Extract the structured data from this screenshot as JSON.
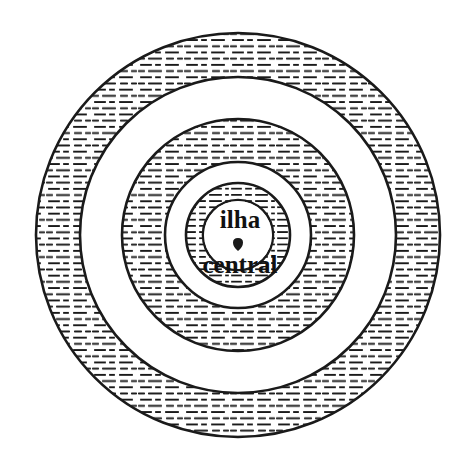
{
  "figure": {
    "type": "concentric-ring-diagram",
    "background_color": "#ffffff",
    "stroke_color": "#1a1a1a",
    "hatch_color": "#1a1a1a",
    "width": 476,
    "height": 464,
    "center": {
      "x": 238,
      "y": 235
    }
  },
  "center_label": {
    "line1": "ilha",
    "line2": "central",
    "separator_marker": "dot-marker",
    "full_text": "ilha central"
  },
  "rings": [
    {
      "name": "outer-hatched-ring",
      "index": 1,
      "outer_radius": 202,
      "inner_radius": 158,
      "fill": "hatched",
      "label": ""
    },
    {
      "name": "outer-gap-ring",
      "index": 2,
      "outer_radius": 158,
      "inner_radius": 116,
      "fill": "white",
      "label": ""
    },
    {
      "name": "middle-hatched-ring",
      "index": 3,
      "outer_radius": 116,
      "inner_radius": 73,
      "fill": "hatched",
      "label": ""
    },
    {
      "name": "inner-gap-ring",
      "index": 4,
      "outer_radius": 73,
      "inner_radius": 52,
      "fill": "white",
      "label": ""
    },
    {
      "name": "inner-hatched-ring",
      "index": 5,
      "outer_radius": 52,
      "inner_radius": 35,
      "fill": "hatched",
      "label": ""
    },
    {
      "name": "center-core-circle",
      "index": 6,
      "outer_radius": 35,
      "inner_radius": 0,
      "fill": "white",
      "label": "ilha central"
    }
  ]
}
